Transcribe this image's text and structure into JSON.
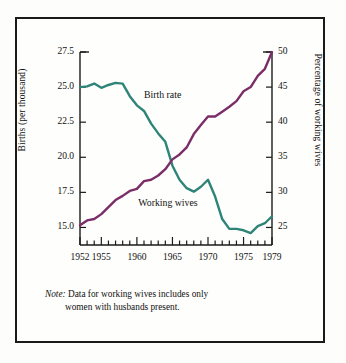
{
  "chart_data": {
    "type": "line",
    "title": "",
    "xlabel": "",
    "ylabel": "Births (per thousand)",
    "y2label": "Percentage of working wives",
    "xlim": [
      1952,
      1979
    ],
    "ylim": [
      13.75,
      27.5
    ],
    "y2lim": [
      22.5,
      50
    ],
    "grid": false,
    "legend": "inline-labels",
    "xticks_major": [
      1952,
      1955,
      1960,
      1965,
      1970,
      1975,
      1979
    ],
    "xticks_minor_step": 1,
    "yticks_left": [
      "15.0",
      "17.5",
      "20.0",
      "22.5",
      "25.0",
      "27.5"
    ],
    "yticks_right": [
      "25",
      "30",
      "35",
      "40",
      "45",
      "50"
    ],
    "x": [
      1952,
      1953,
      1954,
      1955,
      1956,
      1957,
      1958,
      1959,
      1960,
      1961,
      1962,
      1963,
      1964,
      1965,
      1966,
      1967,
      1968,
      1969,
      1970,
      1971,
      1972,
      1973,
      1974,
      1975,
      1976,
      1977,
      1978,
      1979
    ],
    "series": [
      {
        "name": "Birth rate",
        "axis": "left",
        "color": "#2e8577",
        "label_x": 1961.0,
        "label_y": 24.35,
        "values": [
          25.0,
          25.05,
          25.25,
          24.95,
          25.15,
          25.3,
          25.25,
          24.35,
          23.7,
          23.3,
          22.4,
          21.7,
          21.1,
          19.4,
          18.4,
          17.8,
          17.55,
          17.9,
          18.4,
          17.2,
          15.6,
          14.9,
          14.9,
          14.8,
          14.6,
          15.1,
          15.3,
          15.8
        ]
      },
      {
        "name": "Working wives",
        "axis": "right",
        "color": "#7b2d68",
        "label_x": 1960.2,
        "label_y_right": 28.3,
        "values": [
          25.3,
          26.0,
          26.2,
          26.9,
          27.9,
          28.9,
          29.5,
          30.2,
          30.5,
          31.6,
          31.8,
          32.4,
          33.3,
          34.7,
          35.4,
          36.4,
          38.3,
          39.6,
          40.8,
          40.8,
          41.5,
          42.2,
          43.0,
          44.4,
          45.0,
          46.6,
          47.6,
          50.0
        ]
      }
    ]
  },
  "note": {
    "word": "Note:",
    "line1": " Data for working wives includes only",
    "line2": "women with husbands present."
  },
  "axes": {
    "left_label": "Births (per thousand)",
    "right_label": "Percentage of working wives"
  },
  "labels": {
    "birth_rate": "Birth rate",
    "working_wives": "Working wives"
  },
  "ticks": {
    "left": [
      "27.5",
      "25.0",
      "22.5",
      "20.0",
      "17.5",
      "15.0"
    ],
    "right": [
      "50",
      "45",
      "40",
      "35",
      "30",
      "25"
    ],
    "x": [
      "1952",
      "1955",
      "1960",
      "1965",
      "1970",
      "1975",
      "1979"
    ]
  },
  "colors": {
    "birth_rate": "#2e8577",
    "working_wives": "#7b2d68",
    "frame": "#1a1a1a"
  }
}
